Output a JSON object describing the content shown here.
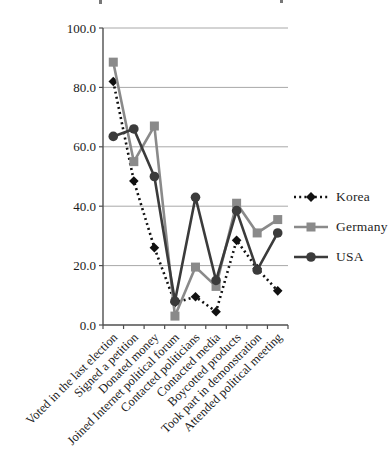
{
  "chart_data": {
    "type": "line",
    "title": "",
    "categories": [
      "Voted in the last election",
      "Signed a petition",
      "Donated money",
      "Joined Internet political forum",
      "Contacted politicians",
      "Contacted media",
      "Boycotted products",
      "Took part in demonstration",
      "Attended political meeting"
    ],
    "series": [
      {
        "name": "Korea",
        "values": [
          82.0,
          48.5,
          26.0,
          7.5,
          9.5,
          4.5,
          28.5,
          19.0,
          11.5
        ],
        "color": "#111111",
        "marker": "diamond",
        "line_style": "dotted"
      },
      {
        "name": "Germany",
        "values": [
          88.5,
          55.0,
          67.0,
          3.0,
          19.5,
          13.0,
          41.0,
          31.0,
          35.5
        ],
        "color": "#8a8a8a",
        "marker": "square",
        "line_style": "solid"
      },
      {
        "name": "USA",
        "values": [
          63.5,
          66.0,
          50.0,
          8.0,
          43.0,
          15.0,
          38.5,
          18.5,
          31.0
        ],
        "color": "#3b3b3b",
        "marker": "circle",
        "line_style": "solid"
      }
    ],
    "ylim": [
      0,
      100
    ],
    "y_ticks": [
      "0.0",
      "20.0",
      "40.0",
      "60.0",
      "80.0",
      "100.0"
    ],
    "xlabel": "",
    "ylabel": "",
    "grid": true,
    "legend_position": "right"
  },
  "colors": {
    "grid": "#a8a8a8",
    "axis": "#4f4f4f",
    "tick_text": "#1a1a1a"
  }
}
